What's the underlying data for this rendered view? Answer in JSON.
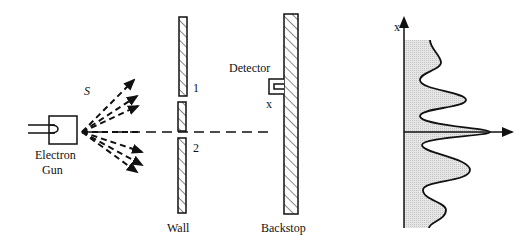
{
  "diagram": {
    "type": "double-slit-experiment",
    "labels": {
      "source": "S",
      "gun_line1": "Electron",
      "gun_line2": "Gun",
      "slit1": "1",
      "slit2": "2",
      "wall": "Wall",
      "detector": "Detector",
      "detector_pos": "x",
      "backstop": "Backstop",
      "graph_axis": "x"
    },
    "graph": {
      "description": "Interference pattern of electron arrival probability vs position x",
      "peaks": 5,
      "central_peak": "largest, at x=0"
    },
    "colors": {
      "line": "#111111",
      "shade": "#d8d8d8",
      "background": "#ffffff"
    }
  }
}
